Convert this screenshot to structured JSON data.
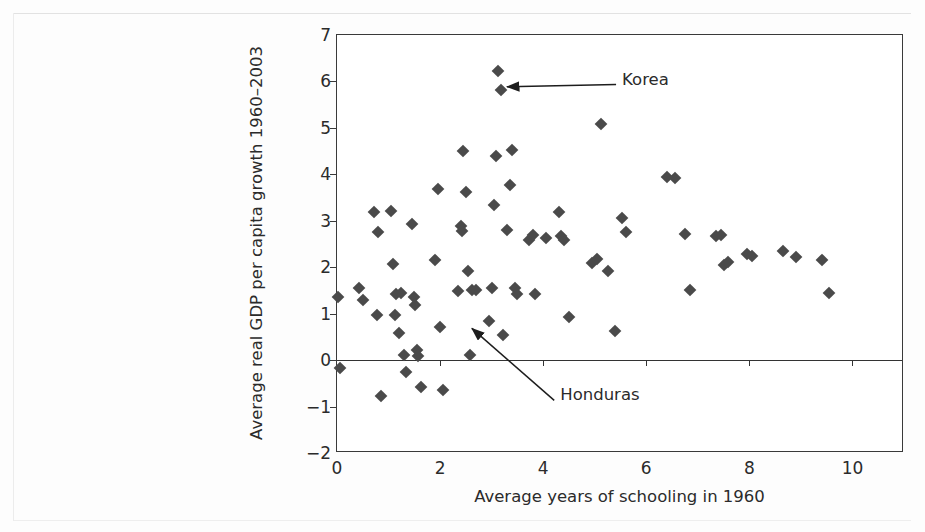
{
  "figure": {
    "background_color": "#fdfdfd",
    "plot_background_color": "#ffffff",
    "frame_color": "#3a3a3a",
    "marker_color": "#4a4a4a"
  },
  "chart_data": {
    "type": "scatter",
    "title": "",
    "xlabel": "Average years of schooling in 1960",
    "ylabel": "Average real GDP per capita growth 1960–2003",
    "xlim": [
      0,
      11
    ],
    "ylim": [
      -2,
      7
    ],
    "xticks": [
      0,
      2,
      4,
      6,
      8,
      10
    ],
    "xtick_labels": [
      "0",
      "2",
      "4",
      "6",
      "8",
      "10"
    ],
    "yticks": [
      -2,
      -1,
      0,
      1,
      2,
      3,
      4,
      5,
      6,
      7
    ],
    "ytick_labels": [
      "−2",
      "−1",
      "0",
      "1",
      "2",
      "3",
      "4",
      "5",
      "6",
      "7"
    ],
    "grid": false,
    "legend": null,
    "zero_line": true,
    "marker_shape": "diamond",
    "points": [
      [
        0.02,
        1.35
      ],
      [
        0.05,
        -0.16
      ],
      [
        0.42,
        1.55
      ],
      [
        0.5,
        1.3
      ],
      [
        0.72,
        3.18
      ],
      [
        0.78,
        0.98
      ],
      [
        0.8,
        2.75
      ],
      [
        0.85,
        -0.78
      ],
      [
        1.05,
        3.2
      ],
      [
        1.08,
        2.08
      ],
      [
        1.12,
        0.98
      ],
      [
        1.15,
        1.42
      ],
      [
        1.2,
        0.58
      ],
      [
        1.24,
        1.45
      ],
      [
        1.3,
        0.12
      ],
      [
        1.33,
        -0.25
      ],
      [
        1.45,
        2.93
      ],
      [
        1.5,
        1.35
      ],
      [
        1.52,
        1.18
      ],
      [
        1.55,
        0.22
      ],
      [
        1.58,
        0.08
      ],
      [
        1.62,
        -0.58
      ],
      [
        1.9,
        2.15
      ],
      [
        1.95,
        3.68
      ],
      [
        2.0,
        0.72
      ],
      [
        2.05,
        -0.65
      ],
      [
        2.35,
        1.48
      ],
      [
        2.4,
        2.88
      ],
      [
        2.42,
        2.78
      ],
      [
        2.45,
        4.5
      ],
      [
        2.5,
        3.62
      ],
      [
        2.55,
        1.92
      ],
      [
        2.58,
        0.1
      ],
      [
        2.62,
        1.52
      ],
      [
        2.7,
        1.5
      ],
      [
        2.95,
        0.85
      ],
      [
        3.0,
        1.55
      ],
      [
        3.05,
        3.35
      ],
      [
        3.08,
        4.4
      ],
      [
        3.12,
        6.22
      ],
      [
        3.18,
        5.82
      ],
      [
        3.22,
        0.55
      ],
      [
        3.3,
        2.8
      ],
      [
        3.35,
        3.78
      ],
      [
        3.4,
        4.52
      ],
      [
        3.45,
        1.55
      ],
      [
        3.5,
        1.42
      ],
      [
        3.72,
        2.58
      ],
      [
        3.8,
        2.7
      ],
      [
        3.85,
        1.42
      ],
      [
        4.05,
        2.62
      ],
      [
        4.3,
        3.18
      ],
      [
        4.35,
        2.68
      ],
      [
        4.4,
        2.58
      ],
      [
        4.5,
        0.92
      ],
      [
        4.95,
        2.1
      ],
      [
        5.05,
        2.18
      ],
      [
        5.12,
        5.08
      ],
      [
        5.25,
        1.92
      ],
      [
        5.4,
        0.62
      ],
      [
        5.52,
        3.05
      ],
      [
        5.6,
        2.75
      ],
      [
        6.4,
        3.95
      ],
      [
        6.55,
        3.92
      ],
      [
        6.75,
        2.72
      ],
      [
        6.85,
        1.5
      ],
      [
        7.35,
        2.68
      ],
      [
        7.45,
        2.7
      ],
      [
        7.5,
        2.05
      ],
      [
        7.58,
        2.12
      ],
      [
        7.95,
        2.28
      ],
      [
        8.05,
        2.25
      ],
      [
        8.65,
        2.35
      ],
      [
        8.9,
        2.22
      ],
      [
        9.4,
        2.15
      ],
      [
        9.55,
        1.45
      ]
    ],
    "annotations": [
      {
        "label": "Korea",
        "point": [
          3.18,
          5.82
        ],
        "label_x": 5.55,
        "label_y": 6.02
      },
      {
        "label": "Honduras",
        "point": [
          2.5,
          0.62
        ],
        "label_x": 4.35,
        "label_y": -0.78
      }
    ]
  }
}
